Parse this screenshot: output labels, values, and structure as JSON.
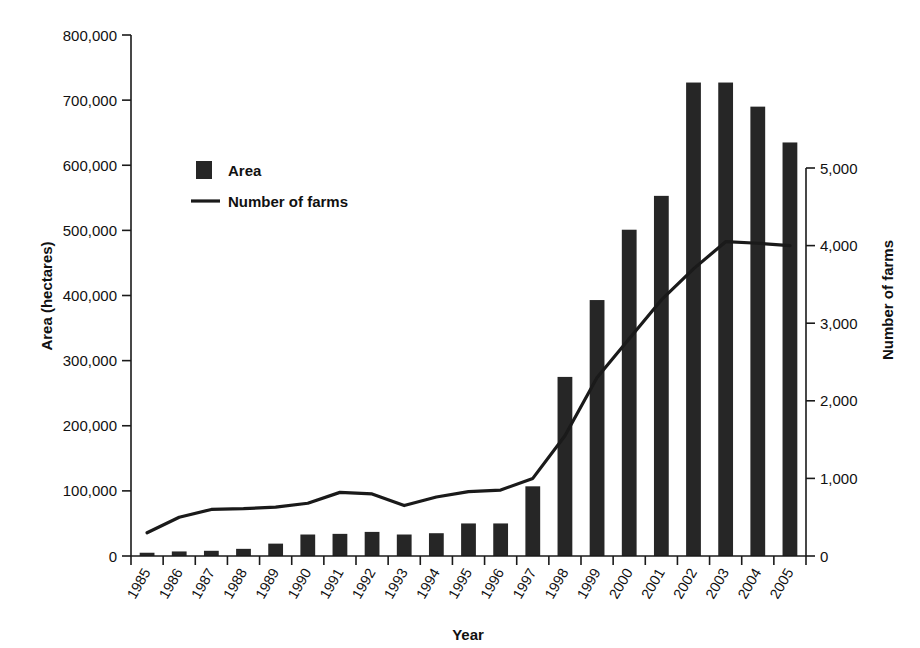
{
  "chart_data": {
    "type": "bar",
    "title": "",
    "xlabel": "Year",
    "ylabel": "Area (hectares)",
    "y2label": "Number of farms",
    "categories": [
      "1985",
      "1986",
      "1987",
      "1988",
      "1989",
      "1990",
      "1991",
      "1992",
      "1993",
      "1994",
      "1995",
      "1996",
      "1997",
      "1998",
      "1999",
      "2000",
      "2001",
      "2002",
      "2003",
      "2004",
      "2005"
    ],
    "ylim": [
      0,
      800000
    ],
    "y2lim": [
      0,
      5000
    ],
    "yticks": [
      "0",
      "100,000",
      "200,000",
      "300,000",
      "400,000",
      "500,000",
      "600,000",
      "700,000",
      "800,000"
    ],
    "ytick_values": [
      0,
      100000,
      200000,
      300000,
      400000,
      500000,
      600000,
      700000,
      800000
    ],
    "y2ticks": [
      "0",
      "1,000",
      "2,000",
      "3,000",
      "4,000",
      "5,000"
    ],
    "y2tick_values": [
      0,
      1000,
      2000,
      3000,
      4000,
      5000
    ],
    "grid": false,
    "legend_position": "upper left",
    "series": [
      {
        "name": "Area",
        "kind": "bar",
        "axis": "left",
        "color": "#262626",
        "values": [
          5000,
          7000,
          8000,
          11000,
          19000,
          33000,
          34000,
          37000,
          33000,
          35000,
          50000,
          50000,
          107000,
          275000,
          393000,
          501000,
          553000,
          727000,
          727000,
          690000,
          635000
        ]
      },
      {
        "name": "Number of farms",
        "kind": "line",
        "axis": "right",
        "color": "#1a1a1a",
        "values": [
          300,
          500,
          600,
          610,
          630,
          680,
          820,
          800,
          650,
          760,
          830,
          850,
          1000,
          1550,
          2300,
          2800,
          3300,
          3700,
          4050,
          4030,
          4000
        ]
      }
    ]
  },
  "legend": {
    "items": [
      {
        "label": "Area",
        "marker": "square-swatch"
      },
      {
        "label": "Number of farms",
        "marker": "line-swatch"
      }
    ]
  }
}
